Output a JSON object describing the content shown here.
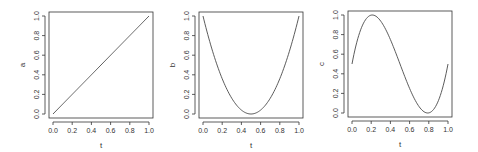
{
  "chart_data": [
    {
      "type": "line",
      "title": "",
      "xlabel": "t",
      "ylabel": "a",
      "xlim": [
        0,
        1
      ],
      "ylim": [
        0,
        1
      ],
      "xticks": [
        "0.0",
        "0.2",
        "0.4",
        "0.6",
        "0.8",
        "1.0"
      ],
      "yticks": [
        "0.0",
        "0.2",
        "0.4",
        "0.6",
        "0.8",
        "1.0"
      ],
      "grid": false,
      "formula": "a = t",
      "x": [
        0,
        0.1,
        0.2,
        0.3,
        0.4,
        0.5,
        0.6,
        0.7,
        0.8,
        0.9,
        1.0
      ],
      "values": [
        0,
        0.1,
        0.2,
        0.3,
        0.4,
        0.5,
        0.6,
        0.7,
        0.8,
        0.9,
        1.0
      ]
    },
    {
      "type": "line",
      "title": "",
      "xlabel": "t",
      "ylabel": "b",
      "xlim": [
        0,
        1
      ],
      "ylim": [
        0,
        1
      ],
      "xticks": [
        "0.0",
        "0.2",
        "0.4",
        "0.6",
        "0.8",
        "1.0"
      ],
      "yticks": [
        "0.0",
        "0.2",
        "0.4",
        "0.6",
        "0.8",
        "1.0"
      ],
      "grid": false,
      "formula": "b = (1 - 2t)^2",
      "x": [
        0,
        0.1,
        0.2,
        0.3,
        0.4,
        0.5,
        0.6,
        0.7,
        0.8,
        0.9,
        1.0
      ],
      "values": [
        1.0,
        0.64,
        0.36,
        0.16,
        0.04,
        0.0,
        0.04,
        0.16,
        0.36,
        0.64,
        1.0
      ]
    },
    {
      "type": "line",
      "title": "",
      "xlabel": "t",
      "ylabel": "c",
      "xlim": [
        0,
        1
      ],
      "ylim": [
        0,
        1
      ],
      "xticks": [
        "0.0",
        "0.2",
        "0.4",
        "0.6",
        "0.8",
        "1.0"
      ],
      "yticks": [
        "0.0",
        "0.2",
        "0.4",
        "0.6",
        "0.8",
        "1.0"
      ],
      "grid": false,
      "formula": "c = 0.5 + 6*sqrt(3)*t*(t-0.5)*(t-1)",
      "x": [
        0,
        0.1,
        0.2,
        0.3,
        0.4,
        0.5,
        0.6,
        0.7,
        0.8,
        0.9,
        1.0
      ],
      "values": [
        0.5,
        0.92,
        1.0,
        0.85,
        0.62,
        0.5,
        0.38,
        0.15,
        0.0,
        0.08,
        0.5
      ]
    }
  ],
  "plots": [
    {
      "xlabel": "t",
      "ylabel": "a"
    },
    {
      "xlabel": "t",
      "ylabel": "b"
    },
    {
      "xlabel": "t",
      "ylabel": "c"
    }
  ],
  "ticks": [
    "0.0",
    "0.2",
    "0.4",
    "0.6",
    "0.8",
    "1.0"
  ],
  "colors": {
    "line": "#4a4a4a",
    "axis": "#333333",
    "background": "#ffffff"
  }
}
